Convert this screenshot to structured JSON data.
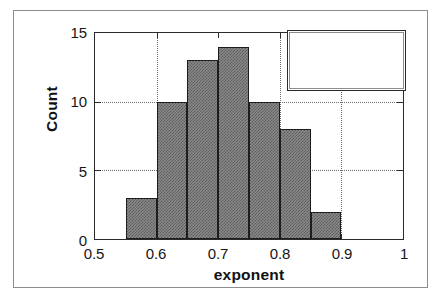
{
  "chart_data": {
    "type": "bar",
    "title": "",
    "subtitle": "",
    "xlabel": "exponent",
    "ylabel": "Count",
    "xlim": [
      0.5,
      1.0
    ],
    "ylim": [
      0,
      15
    ],
    "xticks": [
      "0.5",
      "0.6",
      "0.7",
      "0.8",
      "0.9",
      "1"
    ],
    "xtick_values": [
      0.5,
      0.6,
      0.7,
      0.8,
      0.9,
      1.0
    ],
    "yticks": [
      "0",
      "5",
      "10",
      "15"
    ],
    "ytick_values": [
      0,
      5,
      10,
      15
    ],
    "grid": "dotted gridlines at y = 5, 10 and x = 0.6, 0.8, 0.9",
    "legend_position": "top-right inside plot area",
    "bin_width": 0.05,
    "bin_edges": [
      0.55,
      0.6,
      0.65,
      0.7,
      0.75,
      0.8,
      0.85,
      0.9
    ],
    "categories": [
      "0.55-0.60",
      "0.60-0.65",
      "0.65-0.70",
      "0.70-0.75",
      "0.75-0.80",
      "0.80-0.85",
      "0.85-0.90"
    ],
    "values": [
      3,
      10,
      13,
      14,
      10,
      8,
      2
    ],
    "bars": [
      {
        "x0": 0.55,
        "x1": 0.6,
        "count": 3
      },
      {
        "x0": 0.6,
        "x1": 0.65,
        "count": 10
      },
      {
        "x0": 0.65,
        "x1": 0.7,
        "count": 13
      },
      {
        "x0": 0.7,
        "x1": 0.75,
        "count": 14
      },
      {
        "x0": 0.75,
        "x1": 0.8,
        "count": 10
      },
      {
        "x0": 0.8,
        "x1": 0.85,
        "count": 8
      },
      {
        "x0": 0.85,
        "x1": 0.9,
        "count": 2
      }
    ],
    "colors": {
      "bar_fill": "#8a8a8a",
      "bar_pattern": "#5d5d5d",
      "bar_edge": "#1d1d1d",
      "axis": "#2b2b2b",
      "grid": "#6a6a6a",
      "text": "#161616",
      "background": "#ffffff"
    }
  },
  "stats_box": {
    "title": "statistics",
    "rows": [
      {
        "key": "mean",
        "value": "0.72"
      },
      {
        "key": "std Deviation",
        "value": "0.08"
      },
      {
        "key": "points",
        "value": "60"
      }
    ]
  }
}
